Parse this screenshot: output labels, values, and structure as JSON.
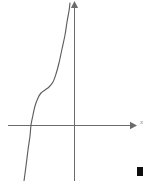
{
  "figure": {
    "title": "",
    "background_color": "#ffffff",
    "axis_color": "#6b6b6b",
    "curve_color": "#5e5e5e",
    "marker_color": "#0d0d0d"
  },
  "axes": {
    "x_axis": {
      "label": "x",
      "label_visible": true,
      "has_arrowhead": true,
      "start_px": [
        8,
        125
      ],
      "end_px": [
        133,
        125
      ]
    },
    "y_axis": {
      "label": "",
      "label_visible": false,
      "has_arrowhead": true,
      "start_px": [
        74,
        181
      ],
      "end_px": [
        74,
        3
      ]
    },
    "origin_px": [
      74,
      125
    ],
    "ticks": [],
    "tick_labels": [],
    "grid": false
  },
  "end_of_proof_marker": {
    "shape": "filled-square",
    "x": 137,
    "y": 167,
    "width": 6,
    "height": 9
  },
  "chart_data": {
    "type": "line",
    "title": "",
    "subtitle": "",
    "xlabel": "x",
    "ylabel": "",
    "grid": false,
    "legend": [],
    "legend_position": "none",
    "annotations": [],
    "axis_ranges": {
      "xlim": [
        -1.5,
        1.6
      ],
      "ylim": [
        -1.6,
        2.3
      ]
    },
    "series": [
      {
        "name": "curve",
        "color": "#5e5e5e",
        "points_px": [
          [
            24,
            181
          ],
          [
            26,
            166
          ],
          [
            28,
            150
          ],
          [
            30,
            136
          ],
          [
            31,
            125
          ],
          [
            33,
            115
          ],
          [
            35,
            106
          ],
          [
            38,
            98
          ],
          [
            41,
            93
          ],
          [
            45,
            90
          ],
          [
            49,
            87
          ],
          [
            53,
            82
          ],
          [
            56,
            74
          ],
          [
            59,
            63
          ],
          [
            62,
            49
          ],
          [
            65,
            35
          ],
          [
            67,
            22
          ],
          [
            69,
            11
          ],
          [
            70,
            3
          ]
        ]
      }
    ]
  }
}
